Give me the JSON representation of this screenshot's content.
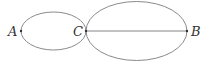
{
  "diagram": {
    "points": [
      {
        "label": "A",
        "x": 21,
        "y": 31
      },
      {
        "label": "C",
        "x": 86,
        "y": 31
      },
      {
        "label": "B",
        "x": 187,
        "y": 31
      }
    ],
    "small_ellipse": {
      "cx": 53.5,
      "cy": 31,
      "rx": 32.5,
      "ry": 19
    },
    "large_ellipse": {
      "cx": 136.5,
      "cy": 31,
      "rx": 50.5,
      "ry": 29.5
    },
    "segment": {
      "from": "C",
      "to": "B"
    },
    "stroke_color": "#888888"
  }
}
